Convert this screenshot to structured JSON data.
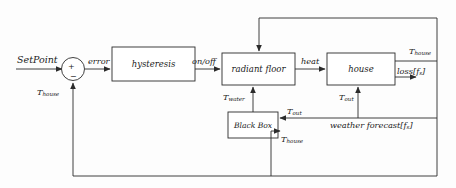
{
  "diagram": {
    "stroke_color": "#2b2b2b",
    "text_color": "#1b1b1b",
    "background": "#fdfdfd",
    "blocks": [
      {
        "id": "hysteresis",
        "label": "hysteresis"
      },
      {
        "id": "radiant_floor",
        "label": "radiant floor"
      },
      {
        "id": "house",
        "label": "house"
      },
      {
        "id": "black_box",
        "label": "Black Box"
      }
    ],
    "summing_junction": {
      "plus": "+",
      "minus": "−"
    },
    "signals": {
      "setpoint": "SetPoint",
      "error": "error",
      "on_off": "on/off",
      "heat": "heat",
      "t_house_out": "T",
      "t_house_out_sub": "house",
      "loss": "loss[f",
      "loss_sub": "s",
      "loss_close": "]",
      "t_water": "T",
      "t_water_sub": "water",
      "t_out_house": "T",
      "t_out_house_sub": "out",
      "t_out_black": "T",
      "t_out_black_sub": "out",
      "weather": "weather forecast[f",
      "weather_sub": "s",
      "weather_close": "]",
      "t_house_black": "T",
      "t_house_black_sub": "house",
      "t_house_feedback": "T",
      "t_house_feedback_sub": "house"
    }
  }
}
